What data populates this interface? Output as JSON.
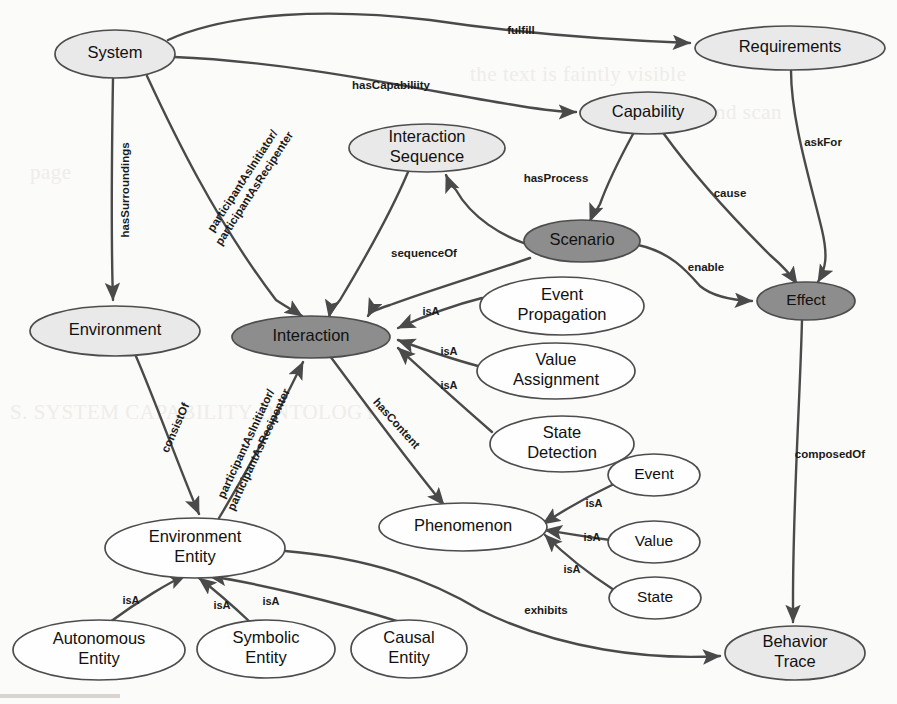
{
  "diagram": {
    "type": "ontology-graph",
    "canvas": {
      "width": 897,
      "height": 704
    },
    "colors": {
      "node_white": "#fefefe",
      "node_light": "#e9e9e9",
      "node_dark": "#8d8d8d",
      "stroke": "#4d4d4d",
      "edge": "#4a4a4a",
      "text": "#111111",
      "background": "#fbfbf9"
    },
    "nodes": [
      {
        "id": "system",
        "label": "System",
        "lines": [
          "System"
        ],
        "cx": 115,
        "cy": 54,
        "rx": 60,
        "ry": 24,
        "fill": "light"
      },
      {
        "id": "requirements",
        "label": "Requirements",
        "lines": [
          "Requirements"
        ],
        "cx": 790,
        "cy": 48,
        "rx": 95,
        "ry": 22,
        "fill": "light"
      },
      {
        "id": "capability",
        "label": "Capability",
        "lines": [
          "Capability"
        ],
        "cx": 648,
        "cy": 113,
        "rx": 68,
        "ry": 21,
        "fill": "light"
      },
      {
        "id": "interaction-seq",
        "label": "Interaction Sequence",
        "lines": [
          "Interaction",
          "Sequence"
        ],
        "cx": 427,
        "cy": 148,
        "rx": 78,
        "ry": 24,
        "fill": "light"
      },
      {
        "id": "scenario",
        "label": "Scenario",
        "lines": [
          "Scenario"
        ],
        "cx": 582,
        "cy": 241,
        "rx": 58,
        "ry": 21,
        "fill": "dark"
      },
      {
        "id": "effect",
        "label": "Effect",
        "lines": [
          "Effect"
        ],
        "cx": 806,
        "cy": 301,
        "rx": 49,
        "ry": 19,
        "fill": "dark"
      },
      {
        "id": "environment",
        "label": "Environment",
        "lines": [
          "Environment"
        ],
        "cx": 115,
        "cy": 331,
        "rx": 85,
        "ry": 25,
        "fill": "light"
      },
      {
        "id": "interaction",
        "label": "Interaction",
        "lines": [
          "Interaction"
        ],
        "cx": 311,
        "cy": 337,
        "rx": 79,
        "ry": 21,
        "fill": "dark"
      },
      {
        "id": "event-propagation",
        "label": "Event Propagation",
        "lines": [
          "Event",
          "Propagation"
        ],
        "cx": 562,
        "cy": 306,
        "rx": 82,
        "ry": 29,
        "fill": "white"
      },
      {
        "id": "value-assignment",
        "label": "Value Assignment",
        "lines": [
          "Value",
          "Assignment"
        ],
        "cx": 556,
        "cy": 371,
        "rx": 79,
        "ry": 28,
        "fill": "white"
      },
      {
        "id": "state-detection",
        "label": "State Detection",
        "lines": [
          "State",
          "Detection"
        ],
        "cx": 562,
        "cy": 444,
        "rx": 72,
        "ry": 28,
        "fill": "white"
      },
      {
        "id": "event",
        "label": "Event",
        "lines": [
          "Event"
        ],
        "cx": 654,
        "cy": 475,
        "rx": 46,
        "ry": 21,
        "fill": "white"
      },
      {
        "id": "value",
        "label": "Value",
        "lines": [
          "Value"
        ],
        "cx": 654,
        "cy": 542,
        "rx": 46,
        "ry": 21,
        "fill": "white"
      },
      {
        "id": "state",
        "label": "State",
        "lines": [
          "State"
        ],
        "cx": 655,
        "cy": 598,
        "rx": 46,
        "ry": 21,
        "fill": "white"
      },
      {
        "id": "phenomenon",
        "label": "Phenomenon",
        "lines": [
          "Phenomenon"
        ],
        "cx": 463,
        "cy": 527,
        "rx": 84,
        "ry": 24,
        "fill": "white"
      },
      {
        "id": "environment-entity",
        "label": "Environment Entity",
        "lines": [
          "Environment",
          "Entity"
        ],
        "cx": 195,
        "cy": 548,
        "rx": 90,
        "ry": 30,
        "fill": "white"
      },
      {
        "id": "autonomous-entity",
        "label": "Autonomous Entity",
        "lines": [
          "Autonomous",
          "Entity"
        ],
        "cx": 99,
        "cy": 650,
        "rx": 86,
        "ry": 30,
        "fill": "white"
      },
      {
        "id": "symbolic-entity",
        "label": "Symbolic Entity",
        "lines": [
          "Symbolic",
          "Entity"
        ],
        "cx": 266,
        "cy": 649,
        "rx": 69,
        "ry": 29,
        "fill": "white"
      },
      {
        "id": "causal-entity",
        "label": "Causal Entity",
        "lines": [
          "Causal",
          "Entity"
        ],
        "cx": 409,
        "cy": 649,
        "rx": 58,
        "ry": 29,
        "fill": "white"
      },
      {
        "id": "behavior-trace",
        "label": "Behavior Trace",
        "lines": [
          "Behavior",
          "Trace"
        ],
        "cx": 795,
        "cy": 653,
        "rx": 70,
        "ry": 27,
        "fill": "light"
      }
    ],
    "edges": [
      {
        "id": "e-fulfill",
        "from": "system",
        "to": "requirements",
        "label": "fulfill",
        "label_x": 521,
        "label_y": 31,
        "rotate": 0,
        "path": "M 168 40 C 230 12, 330 8, 430 20 C 470 26, 560 38, 690 43"
      },
      {
        "id": "e-hascapability",
        "from": "system",
        "to": "capability",
        "label": "hasCapabiliity",
        "label_x": 391,
        "label_y": 86,
        "rotate": 0,
        "path": "M 174 57 C 300 62, 430 92, 520 106 C 545 110, 560 112, 576 112"
      },
      {
        "id": "e-hassurroundings",
        "from": "system",
        "to": "environment",
        "label": "hasSurroundings",
        "label_x": 126,
        "label_y": 190,
        "rotate": -90,
        "path": "M 113 78 C 112 140, 111 240, 113 300"
      },
      {
        "id": "e-participant-si",
        "from": "system",
        "to": "interaction",
        "label": "participantAsInitiator/ participantAsRecipenter",
        "label_x": 249,
        "label_y": 185,
        "rotate": -57,
        "path": "M 147 76 C 172 130, 215 220, 276 300 C 288 308, 296 312, 302 316"
      },
      {
        "id": "e-askfor",
        "from": "requirements",
        "to": "effect",
        "label": "askFor",
        "label_x": 823,
        "label_y": 143,
        "rotate": 0,
        "path": "M 791 70 C 791 120, 810 180, 822 230 C 828 256, 826 268, 818 282"
      },
      {
        "id": "e-hasprocess",
        "from": "capability",
        "to": "scenario",
        "label": "hasProcess",
        "label_x": 556,
        "label_y": 179,
        "rotate": 0,
        "path": "M 633 134 C 620 158, 608 182, 600 204 C 596 212, 592 216, 590 221"
      },
      {
        "id": "e-cause",
        "from": "capability",
        "to": "effect",
        "label": "cause",
        "label_x": 730,
        "label_y": 194,
        "rotate": 0,
        "path": "M 664 134 C 690 170, 730 215, 770 255 C 785 268, 793 278, 797 284"
      },
      {
        "id": "e-sequenceof",
        "from": "scenario",
        "to": "interaction-seq",
        "label": "sequenceOf",
        "label_x": 424,
        "label_y": 254,
        "rotate": 0,
        "path": "M 540 248 C 500 238, 470 215, 456 190 C 450 184, 448 180, 446 175"
      },
      {
        "id": "e-hassequence",
        "from": "interaction-seq",
        "to": "interaction",
        "label": "",
        "label_x": 0,
        "label_y": 0,
        "rotate": 0,
        "path": "M 408 172 C 392 210, 364 260, 340 300 C 333 308, 330 312, 329 317"
      },
      {
        "id": "e-scen-inter",
        "from": "scenario",
        "to": "interaction",
        "label": "",
        "label_x": 0,
        "label_y": 0,
        "rotate": 0,
        "path": "M 530 258 C 490 272, 430 290, 390 305 C 375 310, 370 312, 368 316"
      },
      {
        "id": "e-enable",
        "from": "scenario",
        "to": "effect",
        "label": "enable",
        "label_x": 706,
        "label_y": 268,
        "rotate": 0,
        "path": "M 638 245 C 670 252, 686 270, 700 286 C 712 296, 730 300, 752 301"
      },
      {
        "id": "e-composedof",
        "from": "effect",
        "to": "behavior-trace",
        "label": "composedOf",
        "label_x": 830,
        "label_y": 455,
        "rotate": 0,
        "path": "M 802 320 C 800 400, 793 500, 793 600 C 793 612, 793 618, 793 622"
      },
      {
        "id": "e-consistof",
        "from": "environment",
        "to": "environment-entity",
        "label": "consistOf",
        "label_x": 176,
        "label_y": 428,
        "rotate": -66,
        "path": "M 135 354 C 155 400, 180 470, 199 514"
      },
      {
        "id": "e-participant-ee",
        "from": "environment-entity",
        "to": "interaction",
        "label": "participantAsInitiator/ participantAsRecipenter",
        "label_x": 253,
        "label_y": 447,
        "rotate": -65,
        "path": "M 219 518 C 248 470, 282 405, 303 362"
      },
      {
        "id": "e-isa-ep",
        "from": "event-propagation",
        "to": "interaction",
        "label": "isA",
        "label_x": 431,
        "label_y": 312,
        "rotate": 0,
        "path": "M 482 298 C 450 306, 420 318, 398 328"
      },
      {
        "id": "e-isa-va",
        "from": "value-assignment",
        "to": "interaction",
        "label": "isA",
        "label_x": 449,
        "label_y": 352,
        "rotate": 0,
        "path": "M 478 366 C 448 358, 420 348, 398 340"
      },
      {
        "id": "e-isa-sd",
        "from": "state-detection",
        "to": "interaction",
        "label": "isA",
        "label_x": 449,
        "label_y": 386,
        "rotate": 0,
        "path": "M 492 432 C 455 400, 420 368, 398 348"
      },
      {
        "id": "e-hascontent",
        "from": "interaction",
        "to": "phenomenon",
        "label": "hasContent",
        "label_x": 396,
        "label_y": 424,
        "rotate": 48,
        "path": "M 330 356 C 370 410, 415 470, 444 505"
      },
      {
        "id": "e-isa-event",
        "from": "event",
        "to": "phenomenon",
        "label": "isA",
        "label_x": 594,
        "label_y": 504,
        "rotate": 0,
        "path": "M 612 485 C 580 500, 555 516, 543 524"
      },
      {
        "id": "e-isa-value",
        "from": "value",
        "to": "phenomenon",
        "label": "isA",
        "label_x": 592,
        "label_y": 538,
        "rotate": 0,
        "path": "M 610 540 C 580 536, 558 532, 545 530"
      },
      {
        "id": "e-isa-state",
        "from": "state",
        "to": "phenomenon",
        "label": "isA",
        "label_x": 572,
        "label_y": 570,
        "rotate": 0,
        "path": "M 614 590 C 580 568, 556 546, 545 535"
      },
      {
        "id": "e-isa-auto",
        "from": "autonomous-entity",
        "to": "environment-entity",
        "label": "isA",
        "label_x": 131,
        "label_y": 601,
        "rotate": 0,
        "path": "M 110 622 C 140 600, 170 582, 186 575"
      },
      {
        "id": "e-isa-symb",
        "from": "symbolic-entity",
        "to": "environment-entity",
        "label": "isA",
        "label_x": 222,
        "label_y": 606,
        "rotate": 0,
        "path": "M 250 622 C 232 605, 212 588, 199 578"
      },
      {
        "id": "e-isa-causal",
        "from": "causal-entity",
        "to": "environment-entity",
        "label": "isA",
        "label_x": 271,
        "label_y": 602,
        "rotate": 0,
        "path": "M 400 622 C 330 600, 250 582, 209 576"
      },
      {
        "id": "e-exhibits",
        "from": "environment-entity",
        "to": "behavior-trace",
        "label": "exhibits",
        "label_x": 546,
        "label_y": 611,
        "rotate": 0,
        "path": "M 285 551 C 370 558, 430 580, 480 610 C 560 650, 650 660, 720 656"
      }
    ],
    "legend_note": ""
  },
  "ghost_text": [
    {
      "text": "the text is faintly visible",
      "x": 470,
      "y": 62
    },
    {
      "text": "the background scan",
      "x": 600,
      "y": 100
    },
    {
      "text": "page",
      "x": 30,
      "y": 160
    },
    {
      "text": "S. SYSTEM CAPABILITY ONTOLOGY",
      "x": 10,
      "y": 400
    }
  ]
}
